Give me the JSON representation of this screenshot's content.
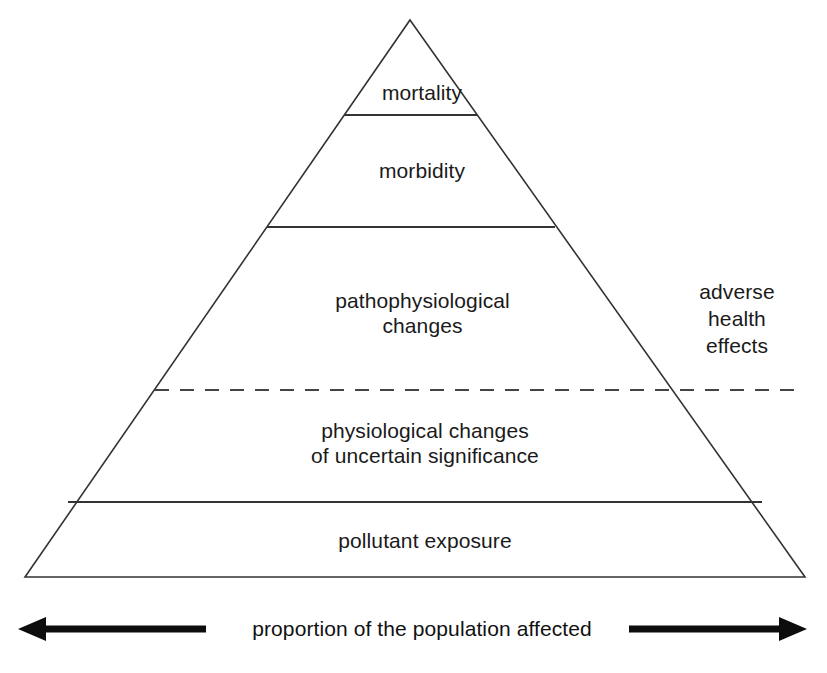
{
  "figure": {
    "background_color": "#ffffff",
    "line_color": "#333333",
    "text_color": "#1a1a1a"
  },
  "pyramid": {
    "tiers": [
      {
        "id": "mortality",
        "label": "mortality",
        "order": 1
      },
      {
        "id": "morbidity",
        "label": "morbidity",
        "order": 2
      },
      {
        "id": "patho",
        "label": "pathophysiological\nchanges",
        "order": 3
      },
      {
        "id": "physio",
        "label": "physiological changes\nof uncertain significance",
        "order": 4
      },
      {
        "id": "pollutant",
        "label": "pollutant exposure",
        "order": 5
      }
    ],
    "divider_style": {
      "solid": "solid",
      "dashed": "dashed"
    }
  },
  "annotations": {
    "side_label": "adverse\nhealth\neffects",
    "axis_caption": "proportion of the population affected",
    "axis_arrow_left": "left-arrow",
    "axis_arrow_right": "right-arrow"
  }
}
